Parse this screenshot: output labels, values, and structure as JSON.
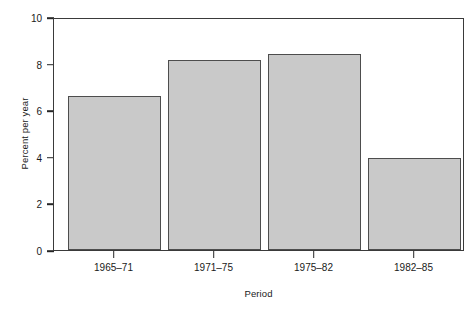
{
  "chart_data": {
    "type": "bar",
    "title": "",
    "subtitle": "",
    "xlabel": "Period",
    "ylabel": "Percent per year",
    "categories": [
      "1965–71",
      "1971–75",
      "1975–82",
      "1982–85"
    ],
    "values": [
      6.7,
      8.25,
      8.55,
      4.0
    ],
    "series": [
      {
        "name": "Percent per year",
        "values": [
          6.7,
          8.25,
          8.55,
          4.0
        ]
      }
    ],
    "ylim": [
      0,
      10
    ],
    "ytick_values": [
      0,
      2,
      4,
      6,
      8,
      10
    ],
    "ytick_labels": [
      "0",
      "2",
      "4",
      "6",
      "8",
      "10"
    ],
    "xtick_labels": [
      "1965–71",
      "1971–75",
      "1975–82",
      "1982–85"
    ],
    "grid": false,
    "legend": false,
    "legend_position": "none",
    "annotations": [],
    "bar_fill_color": "#c9c9c9",
    "bar_edge_color": "#4d4d4d",
    "frame_color": "#3a3a3a",
    "background_color": "#ffffff",
    "text_color": "#1a1a1a"
  }
}
